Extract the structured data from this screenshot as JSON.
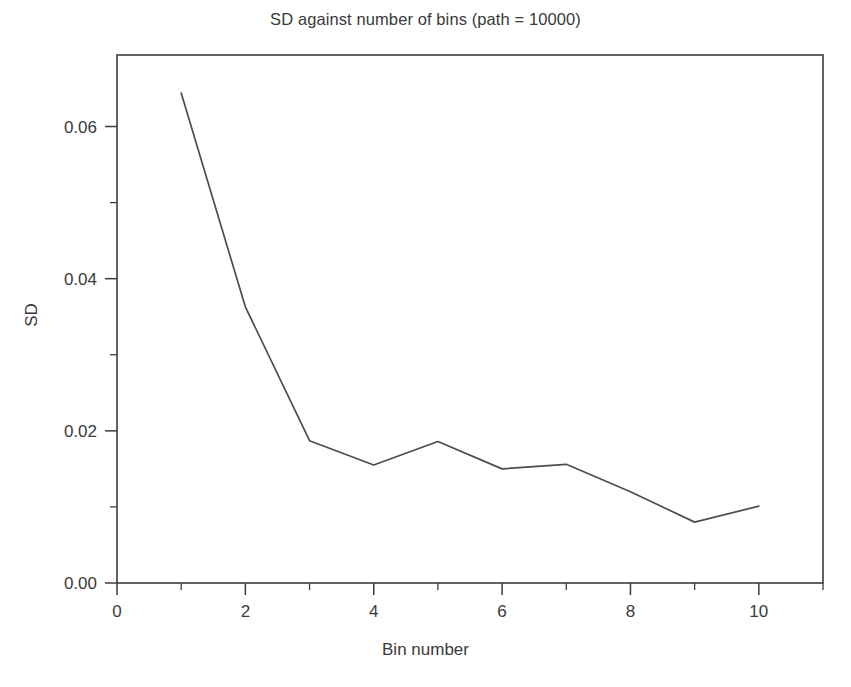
{
  "chart_data": {
    "type": "line",
    "title": "SD against number of bins (path = 10000)",
    "xlabel": "Bin number",
    "ylabel": "SD",
    "x": [
      1,
      2,
      3,
      4,
      5,
      6,
      7,
      8,
      9,
      10
    ],
    "values": [
      0.0644,
      0.0363,
      0.0187,
      0.0155,
      0.0186,
      0.015,
      0.0156,
      0.012,
      0.008,
      0.0101
    ],
    "series": [
      {
        "name": "SD",
        "values": [
          0.0644,
          0.0363,
          0.0187,
          0.0155,
          0.0186,
          0.015,
          0.0156,
          0.012,
          0.008,
          0.0101
        ]
      }
    ],
    "xlim": [
      0,
      11
    ],
    "ylim": [
      0.0,
      0.0694
    ],
    "xticks": [
      0,
      2,
      4,
      6,
      8,
      10
    ],
    "xtick_labels": [
      "0",
      "2",
      "4",
      "6",
      "8",
      "10"
    ],
    "xminor_ticks": [
      1,
      3,
      5,
      7,
      9,
      11
    ],
    "yticks": [
      0.0,
      0.02,
      0.04,
      0.06
    ],
    "ytick_labels": [
      "0.00",
      "0.02",
      "0.04",
      "0.06"
    ],
    "yminor_ticks": [
      0.01,
      0.03,
      0.05,
      0.07
    ],
    "grid": false,
    "legend": false,
    "line_color": "#4d4d4d",
    "frame_color": "#3c3c3c",
    "background": "#ffffff"
  }
}
